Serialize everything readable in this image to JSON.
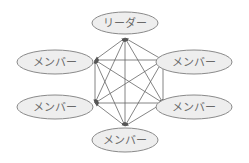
{
  "diagram": {
    "type": "fully-connected network (all-channel communication)",
    "colors": {
      "node_fill": "#eeeeee",
      "node_stroke": "#8a8a8a",
      "label": "#6a6a6a",
      "edge": "#666666"
    },
    "nodes": [
      {
        "id": "leader",
        "label": "リーダー",
        "cx": 125,
        "cy": 23,
        "rx": 33,
        "ry": 11,
        "ax": 125,
        "ay": 38
      },
      {
        "id": "member-top-left",
        "label": "メンバー",
        "cx": 55,
        "cy": 62,
        "rx": 38,
        "ry": 12,
        "ax": 95,
        "ay": 60
      },
      {
        "id": "member-top-right",
        "label": "メンバー",
        "cx": 194,
        "cy": 62,
        "rx": 38,
        "ry": 12,
        "ax": 163,
        "ay": 60
      },
      {
        "id": "member-bottom-left",
        "label": "メンバー",
        "cx": 55,
        "cy": 107,
        "rx": 38,
        "ry": 12,
        "ax": 95,
        "ay": 103
      },
      {
        "id": "member-bottom-right",
        "label": "メンバー",
        "cx": 194,
        "cy": 107,
        "rx": 38,
        "ry": 12,
        "ax": 163,
        "ay": 103
      },
      {
        "id": "member-bottom",
        "label": "メンバー",
        "cx": 125,
        "cy": 140,
        "rx": 33,
        "ry": 12,
        "ax": 125,
        "ay": 126
      }
    ],
    "edges": [
      {
        "from": "leader",
        "to": "member-top-left",
        "bidirectional": true
      },
      {
        "from": "leader",
        "to": "member-top-right",
        "bidirectional": true
      },
      {
        "from": "leader",
        "to": "member-bottom-left",
        "bidirectional": true
      },
      {
        "from": "leader",
        "to": "member-bottom-right",
        "bidirectional": true
      },
      {
        "from": "leader",
        "to": "member-bottom",
        "bidirectional": true
      },
      {
        "from": "member-top-left",
        "to": "member-top-right",
        "bidirectional": true
      },
      {
        "from": "member-top-left",
        "to": "member-bottom-left",
        "bidirectional": true
      },
      {
        "from": "member-top-left",
        "to": "member-bottom-right",
        "bidirectional": true
      },
      {
        "from": "member-top-left",
        "to": "member-bottom",
        "bidirectional": true
      },
      {
        "from": "member-top-right",
        "to": "member-bottom-left",
        "bidirectional": true
      },
      {
        "from": "member-top-right",
        "to": "member-bottom-right",
        "bidirectional": true
      },
      {
        "from": "member-top-right",
        "to": "member-bottom",
        "bidirectional": true
      },
      {
        "from": "member-bottom-left",
        "to": "member-bottom-right",
        "bidirectional": true
      },
      {
        "from": "member-bottom-left",
        "to": "member-bottom",
        "bidirectional": true
      },
      {
        "from": "member-bottom-right",
        "to": "member-bottom",
        "bidirectional": true
      }
    ]
  }
}
